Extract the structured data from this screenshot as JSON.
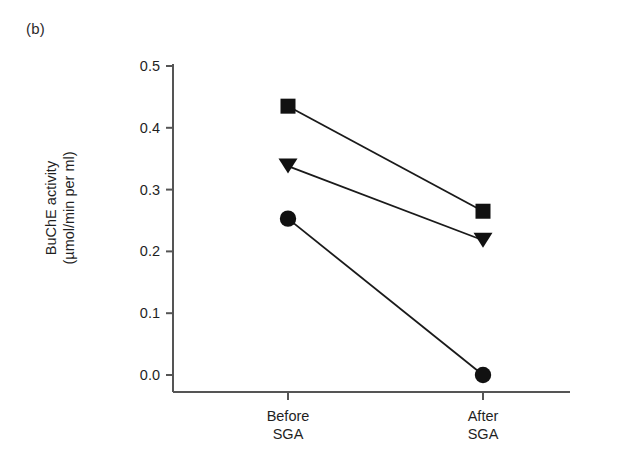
{
  "panel": {
    "label": "(b)"
  },
  "chart_data": {
    "type": "line",
    "title": "",
    "subtitle": "",
    "panel_label": "(b)",
    "xlabel": "",
    "ylabel_line1": "BuChE activity",
    "ylabel_line2": "(µmol/min per ml)",
    "ylabel": "BuChE activity (µmol/min per ml)",
    "categories": [
      "Before\nSGA",
      "After\nSGA"
    ],
    "category_labels": [
      {
        "line1": "Before",
        "line2": "SGA"
      },
      {
        "line1": "After",
        "line2": "SGA"
      }
    ],
    "x": [
      0,
      1
    ],
    "ylim": [
      0.0,
      0.5
    ],
    "xlim": [
      -0.35,
      1.35
    ],
    "yticks": [
      0.0,
      0.1,
      0.2,
      0.3,
      0.4,
      0.5
    ],
    "ytick_labels": [
      "0.0",
      "0.1",
      "0.2",
      "0.3",
      "0.4",
      "0.5"
    ],
    "grid": false,
    "legend": "none",
    "series": [
      {
        "name": "subject-square",
        "marker": "square",
        "values": [
          0.435,
          0.265
        ]
      },
      {
        "name": "subject-triangle",
        "marker": "triangle-down",
        "values": [
          0.338,
          0.218
        ]
      },
      {
        "name": "subject-circle",
        "marker": "circle",
        "values": [
          0.253,
          0.0
        ]
      }
    ],
    "colors": {
      "marker": "#111111",
      "line": "#1a1a1a",
      "axis": "#555555",
      "text": "#1f1f1f",
      "background": "#ffffff"
    }
  },
  "axis_geometry": {
    "plot_left": 173,
    "plot_right": 570,
    "y_top_px": 66,
    "y_bottom_px": 375,
    "x_axis_px": 392,
    "cat_x_px": [
      288,
      483
    ]
  }
}
